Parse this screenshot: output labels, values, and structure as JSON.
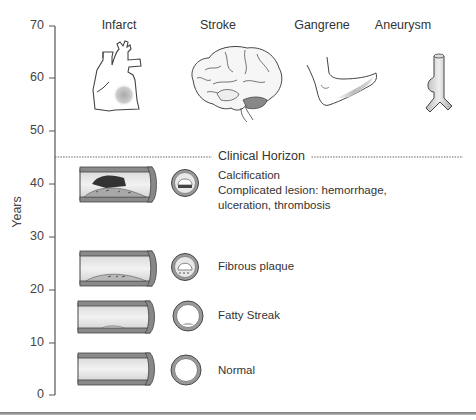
{
  "figure": {
    "y_axis": {
      "label": "Years",
      "ticks": [
        "70",
        "60",
        "50",
        "40",
        "30",
        "20",
        "10",
        "0"
      ],
      "range": [
        0,
        70
      ]
    },
    "clinical_horizon": {
      "label": "Clinical Horizon",
      "years": 45
    },
    "outcomes": [
      {
        "label": "Infarct",
        "icon": "heart-icon"
      },
      {
        "label": "Stroke",
        "icon": "brain-icon"
      },
      {
        "label": "Gangrene",
        "icon": "foot-icon"
      },
      {
        "label": "Aneurysm",
        "icon": "aneurysm-vessel-icon"
      }
    ],
    "stages": [
      {
        "lines": [
          "Calcification",
          "Complicated lesion: hemorrhage,",
          "ulceration, thrombosis"
        ],
        "years": 40
      },
      {
        "lines": [
          "Fibrous plaque"
        ],
        "years": 25
      },
      {
        "lines": [
          "Fatty Streak"
        ],
        "years": 15
      },
      {
        "lines": [
          "Normal"
        ],
        "years": 5
      }
    ]
  }
}
